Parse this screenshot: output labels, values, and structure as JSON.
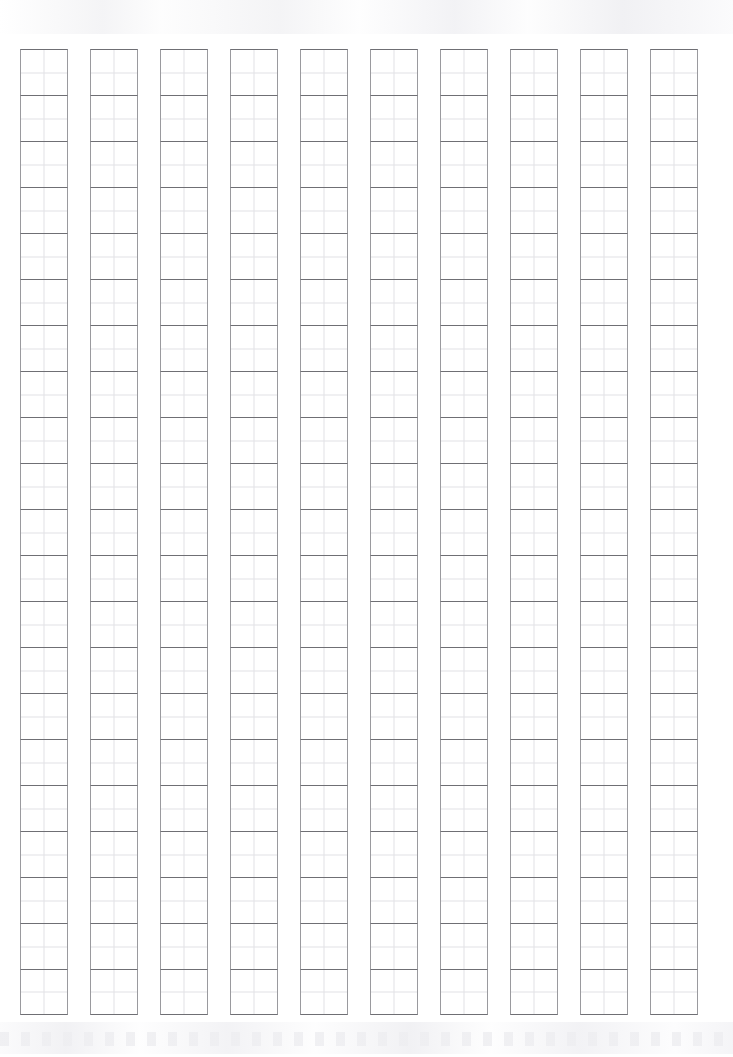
{
  "page": {
    "background_color": "#ffffff",
    "width_px": 733,
    "height_px": 1057
  },
  "sheet": {
    "type": "tianzige-practice-grid",
    "description": "Blank Chinese character writing practice sheet",
    "columns": 10,
    "rows_per_column": 21,
    "total_cells": 210,
    "cell_width_px": 48,
    "cell_height_px": 46,
    "column_gap_px": 22,
    "grid_left_px": 20,
    "grid_top_px": 49,
    "grid_right_px": 700,
    "grid_bottom_px": 1015,
    "cell_content": "",
    "guides": {
      "vertical_center": true,
      "horizontal_center": true,
      "diagonals": false
    },
    "colors": {
      "cell_border_horizontal": "#6f6f74",
      "cell_border_vertical": "#9a9a9e",
      "guide_line": "#e2e2e6",
      "paper": "#ffffff",
      "scan_artifact": "#f1f1f4"
    }
  },
  "artifacts": {
    "top_band_label": "scan-noise-band-top",
    "bottom_band_label": "scan-noise-band-bottom"
  }
}
